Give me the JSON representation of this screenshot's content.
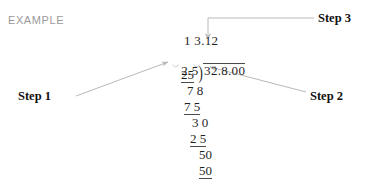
{
  "page": {
    "kind": "worked-example-long-division",
    "background_color": "#ffffff",
    "ink_color": "#1f1f1f",
    "label_color": "#9a9a9a"
  },
  "example": {
    "label": "EXAMPLE"
  },
  "callouts": [
    {
      "id": "step-1",
      "label": "Step 1",
      "points_at": "divisor 2.5"
    },
    {
      "id": "step-2",
      "label": "Step 2",
      "points_at": "dividend decimal point 32.8.00"
    },
    {
      "id": "step-3",
      "label": "Step 3",
      "points_at": "quotient 1 3.12"
    }
  ],
  "division": {
    "quotient": "1 3.12",
    "divisor": "2.5",
    "bracket": ")",
    "dividend": "32.8.00",
    "work_rows": [
      {
        "id": "row-25",
        "value": "25",
        "underlined": true
      },
      {
        "id": "row-78",
        "value": "7 8",
        "underlined": false
      },
      {
        "id": "row-75",
        "value": "7 5",
        "underlined": true
      },
      {
        "id": "row-30",
        "value": "3 0",
        "underlined": false
      },
      {
        "id": "row-25b",
        "value": "2 5",
        "underlined": true
      },
      {
        "id": "row-50",
        "value": "50",
        "underlined": false
      },
      {
        "id": "row-50b",
        "value": "50",
        "underlined": true
      }
    ],
    "decimal_shift_marks": 2
  }
}
